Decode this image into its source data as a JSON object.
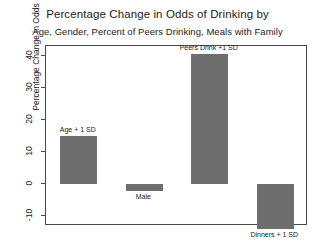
{
  "chart_data": {
    "type": "bar",
    "title": "Percentage Change in Odds of Drinking by",
    "subtitle": "Age, Gender, Percent of Peers Drinking, Meals with Family",
    "xlabel": "",
    "ylabel": "Percentage Change in Odds",
    "ylim": [
      -13,
      43
    ],
    "yticks": [
      -10,
      0,
      10,
      20,
      30,
      40
    ],
    "ytick_labels": [
      "-10",
      "0",
      "10",
      "20",
      "30",
      "40"
    ],
    "grid": false,
    "legend": "none",
    "bar_color": "#6e6e6e",
    "categories": [
      "Age + 1 SD",
      "Male",
      "Peers Drink +1 SD",
      "Dinners + 1 SD"
    ],
    "values": [
      15,
      -2,
      40.5,
      -14
    ],
    "labels": [
      {
        "text": "Age + 1 SD",
        "value": 15,
        "position": "above"
      },
      {
        "text": "Male",
        "value": -2,
        "position": "below"
      },
      {
        "text": "Peers Drink +1 SD",
        "value": 40.5,
        "position": "above"
      },
      {
        "text": "Dinners + 1 SD",
        "value": -14,
        "position": "below"
      }
    ]
  }
}
